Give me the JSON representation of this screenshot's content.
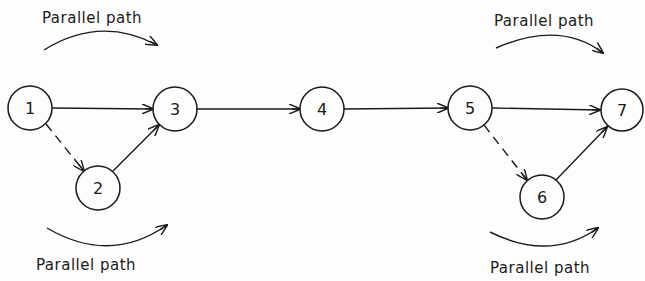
{
  "diagram": {
    "nodes": [
      {
        "id": "1",
        "label": "1",
        "x": 30,
        "y": 108
      },
      {
        "id": "2",
        "label": "2",
        "x": 98,
        "y": 188
      },
      {
        "id": "3",
        "label": "3",
        "x": 175,
        "y": 109
      },
      {
        "id": "4",
        "label": "4",
        "x": 322,
        "y": 109
      },
      {
        "id": "5",
        "label": "5",
        "x": 470,
        "y": 108
      },
      {
        "id": "6",
        "label": "6",
        "x": 542,
        "y": 197
      },
      {
        "id": "7",
        "label": "7",
        "x": 622,
        "y": 110
      }
    ],
    "edges": [
      {
        "from": "1",
        "to": "3",
        "style": "solid"
      },
      {
        "from": "1",
        "to": "2",
        "style": "dashed"
      },
      {
        "from": "2",
        "to": "3",
        "style": "solid"
      },
      {
        "from": "3",
        "to": "4",
        "style": "solid"
      },
      {
        "from": "4",
        "to": "5",
        "style": "solid"
      },
      {
        "from": "5",
        "to": "7",
        "style": "solid"
      },
      {
        "from": "5",
        "to": "6",
        "style": "dashed"
      },
      {
        "from": "6",
        "to": "7",
        "style": "solid"
      }
    ],
    "annotations": {
      "top_left": "Parallel path",
      "bottom_left": "Parallel path",
      "top_right": "Parallel path",
      "bottom_right": "Parallel path"
    }
  }
}
